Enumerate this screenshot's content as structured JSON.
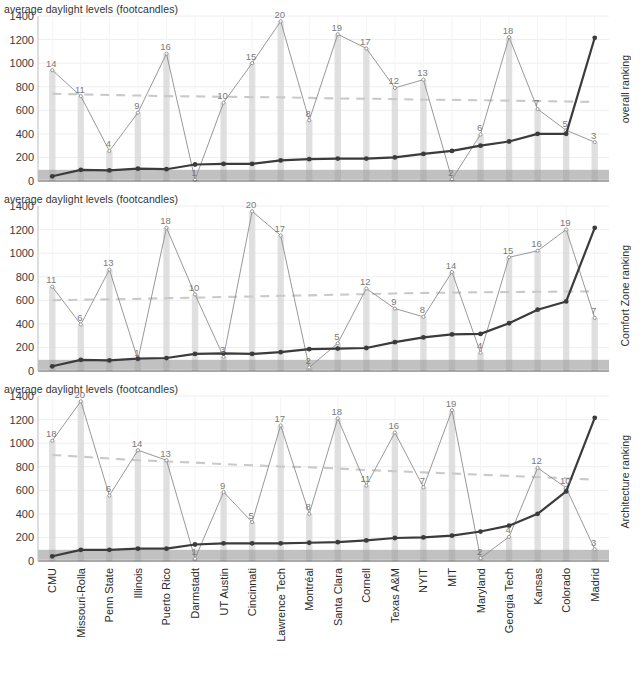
{
  "figure": {
    "width": 642,
    "height": 674,
    "axis_title": "average daylight levels (footcandles)",
    "y_ticks": [
      0,
      200,
      400,
      600,
      800,
      1000,
      1200,
      1400
    ],
    "y_min": 0,
    "y_max": 1400,
    "colors": {
      "rank_line": "#8c8c8c",
      "value_line": "#3b3b3b",
      "bar": "#d6d6d6",
      "band": "#9b9b9b",
      "trend": "#c9c9c9",
      "grid": "#eeeeee",
      "axis": "#555555",
      "text": "#2b2b2b"
    }
  },
  "chart_data": {
    "type": "line",
    "title": "average daylight levels (footcandles)",
    "xlabel": "",
    "ylabel": "average daylight levels (footcandles)",
    "ylim": [
      0,
      1400
    ],
    "grid": true,
    "legend": "none",
    "categories": [
      "CMU",
      "Missouri-Rolla",
      "Penn State",
      "Illinois",
      "Puerto Rico",
      "Darmstadt",
      "UT Austin",
      "Cincinnati",
      "Lawrence Tech",
      "Montréal",
      "Santa Clara",
      "Cornell",
      "Texas A&M",
      "NYIT",
      "MIT",
      "Maryland",
      "Georgia Tech",
      "Kansas",
      "Colorado",
      "Madrid"
    ],
    "panels": [
      {
        "id": "overall",
        "right_label": "overall ranking",
        "rank_labels": [
          14,
          11,
          4,
          9,
          16,
          1,
          10,
          15,
          20,
          8,
          19,
          17,
          12,
          13,
          2,
          6,
          18,
          7,
          5,
          3
        ],
        "rank_values": [
          940,
          720,
          255,
          580,
          1080,
          10,
          665,
          1000,
          1355,
          515,
          1245,
          1125,
          790,
          860,
          15,
          395,
          1220,
          610,
          430,
          330
        ],
        "daylight_values": [
          40,
          95,
          90,
          105,
          100,
          140,
          145,
          145,
          175,
          185,
          190,
          190,
          200,
          230,
          255,
          300,
          335,
          400,
          400,
          1215
        ],
        "trend_values": [
          740,
          735,
          730,
          725,
          720,
          718,
          715,
          712,
          710,
          705,
          700,
          698,
          695,
          690,
          688,
          685,
          682,
          678,
          675,
          670
        ]
      },
      {
        "id": "comfort",
        "right_label": "Comfort Zone ranking",
        "rank_labels": [
          11,
          6,
          13,
          1,
          18,
          10,
          3,
          20,
          17,
          2,
          5,
          12,
          9,
          8,
          14,
          4,
          15,
          16,
          19,
          7
        ],
        "rank_values": [
          715,
          395,
          860,
          95,
          1215,
          650,
          120,
          1355,
          1150,
          30,
          235,
          700,
          530,
          460,
          840,
          155,
          965,
          1020,
          1200,
          450
        ],
        "daylight_values": [
          40,
          95,
          90,
          105,
          110,
          145,
          150,
          145,
          160,
          185,
          190,
          195,
          245,
          285,
          310,
          315,
          405,
          520,
          590,
          1215
        ],
        "trend_values": [
          600,
          605,
          608,
          612,
          618,
          622,
          628,
          632,
          638,
          642,
          648,
          652,
          658,
          662,
          665,
          668,
          670,
          672,
          674,
          676
        ]
      },
      {
        "id": "architecture",
        "right_label": "Architecture ranking",
        "rank_labels": [
          18,
          20,
          6,
          14,
          13,
          1,
          9,
          5,
          17,
          8,
          18,
          11,
          16,
          7,
          19,
          2,
          4,
          12,
          10,
          3
        ],
        "rank_values": [
          1020,
          1355,
          555,
          940,
          855,
          20,
          585,
          330,
          1150,
          400,
          1210,
          640,
          1090,
          625,
          1280,
          25,
          205,
          790,
          620,
          100
        ],
        "daylight_values": [
          40,
          95,
          95,
          105,
          105,
          140,
          150,
          150,
          150,
          155,
          160,
          175,
          195,
          200,
          215,
          250,
          300,
          400,
          590,
          1215
        ],
        "trend_values": [
          900,
          885,
          870,
          855,
          845,
          835,
          822,
          812,
          802,
          795,
          785,
          772,
          762,
          752,
          742,
          732,
          722,
          712,
          702,
          690
        ]
      }
    ]
  }
}
